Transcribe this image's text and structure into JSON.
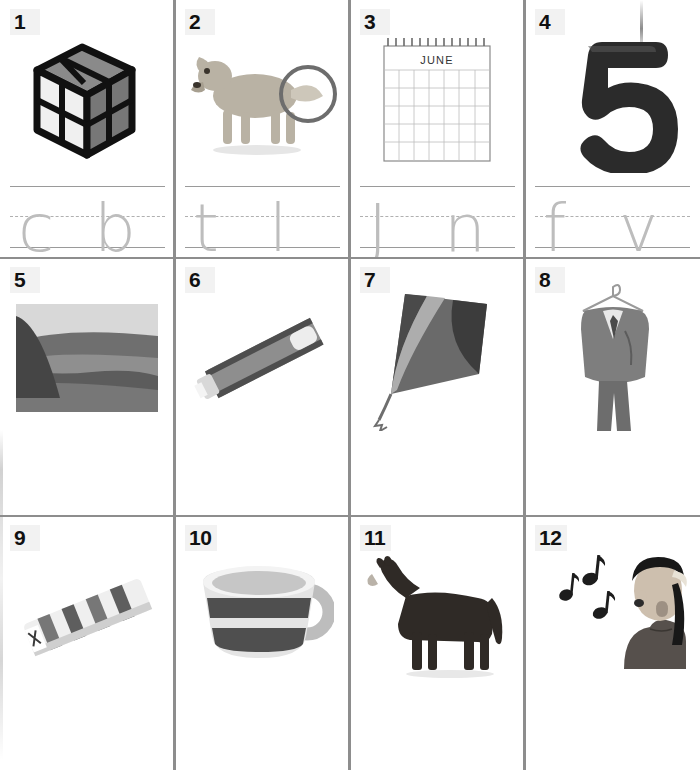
{
  "worksheet": {
    "type": "phonics-letter-tracing-worksheet",
    "rows": 3,
    "columns": 4,
    "total_items": 12,
    "line_style": "three-line handwriting guide: solid top, dashed midline, solid baseline",
    "colors": {
      "grid_line": "#8d8d8d",
      "writing_line": "#9a9a9a",
      "writing_midline": "#b0b0b0",
      "letter_gray": "#bdbdbd",
      "number_text": "#111111",
      "number_badge_bg": "#f2f2f2",
      "page_bg": "#ffffff"
    }
  },
  "items": [
    {
      "number": "1",
      "picture": "rubiks-cube",
      "picture_description": "2x2 Rubik's cube with black frame, white and gray faces",
      "letters": {
        "first": "c",
        "second": "b"
      }
    },
    {
      "number": "2",
      "picture": "dog-with-circled-tail",
      "picture_description": "golden retriever dog standing in profile with a circle drawn around its tail",
      "letters": {
        "first": "t",
        "second": "l"
      }
    },
    {
      "number": "3",
      "picture": "calendar",
      "picture_description": "spiral-bound wall calendar page",
      "calendar_month": "JUNE",
      "letters": {
        "first": "J",
        "second": "n"
      }
    },
    {
      "number": "4",
      "picture": "number-five",
      "picture_description": "large black three-dimensional numeral five",
      "digit_shown": "5",
      "letters": {
        "first": "f",
        "second": "v"
      }
    },
    {
      "number": "5",
      "picture": "hill-landscape",
      "picture_description": "grayscale photograph of a grassy hill and valley",
      "letters": {
        "first": "l",
        "second": "k"
      }
    },
    {
      "number": "6",
      "picture": "toothpaste-tube",
      "picture_description": "patterned toothpaste tube lying at an angle with cap off",
      "letters": {
        "first": "t",
        "second": "b"
      }
    },
    {
      "number": "7",
      "picture": "kite",
      "picture_description": "diamond kite with curved dark and light bands and a tail",
      "letters": {
        "first": "k",
        "second": "t"
      }
    },
    {
      "number": "8",
      "picture": "suit-on-hanger",
      "picture_description": "gray business suit jacket and trousers on a wire hanger",
      "letters": {
        "first": "s",
        "second": "t"
      }
    },
    {
      "number": "9",
      "picture": "striped-mat",
      "picture_description": "rolled striped mat or gum pack viewed at an angle",
      "letters": {
        "first": "g",
        "second": "m"
      }
    },
    {
      "number": "10",
      "picture": "cup",
      "picture_description": "ceramic cup with two dark horizontal stripes and a round handle",
      "letters": {
        "first": "c",
        "second": "p"
      }
    },
    {
      "number": "11",
      "picture": "horse",
      "picture_description": "dark brown horse standing in profile facing left",
      "letters": {
        "first": "m",
        "second": "l"
      }
    },
    {
      "number": "12",
      "picture": "girl-singing",
      "picture_description": "girl with headband singing, three musical eighth notes beside her",
      "letters": {
        "first": "t",
        "second": "n"
      }
    }
  ]
}
